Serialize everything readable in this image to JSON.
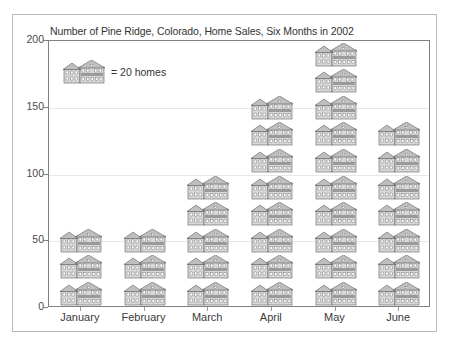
{
  "chart_data": {
    "type": "bar",
    "subtype": "pictograph",
    "title": "Number of Pine Ridge, Colorado, Home Sales, Six Months in 2002",
    "xlabel": "",
    "ylabel": "",
    "ylim": [
      0,
      200
    ],
    "yticks": [
      0,
      50,
      100,
      150,
      200
    ],
    "grid": true,
    "legend_position": "inside-top-left",
    "icon_unit_value": 20,
    "icon_name": "house-icon",
    "legend_label": "= 20 homes",
    "categories": [
      "January",
      "February",
      "March",
      "April",
      "May",
      "June"
    ],
    "values": [
      60,
      60,
      95,
      155,
      195,
      135
    ],
    "icon_counts": [
      3,
      3,
      5,
      8,
      10,
      7
    ],
    "series": [
      {
        "name": "Home Sales",
        "values": [
          60,
          60,
          95,
          155,
          195,
          135
        ]
      }
    ]
  },
  "axis": {
    "yticks": [
      "200",
      "150",
      "100",
      "50",
      "0"
    ],
    "xlabels": [
      "January",
      "February",
      "March",
      "April",
      "May",
      "June"
    ]
  },
  "legend": {
    "label": "= 20 homes"
  },
  "colors": {
    "house_fill": "#d8d8d8",
    "house_stroke": "#555555",
    "roof_fill": "#bfbfbf",
    "axis": "#808080",
    "grid": "#e8e8e8",
    "text": "#333333",
    "frame": "#b9b9b9"
  }
}
